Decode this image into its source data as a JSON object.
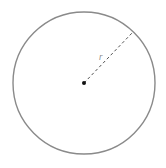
{
  "diagram": {
    "type": "circle-radius",
    "center": {
      "x": 84,
      "y": 83
    },
    "radius": 71,
    "radius_endpoint": {
      "x": 133,
      "y": 32
    },
    "labels": {
      "radius": "r"
    },
    "colors": {
      "circle_stroke": "#8a8a8a",
      "radius_line": "#555555",
      "center_point": "#111111",
      "label": "#888888",
      "background": "#ffffff"
    }
  }
}
